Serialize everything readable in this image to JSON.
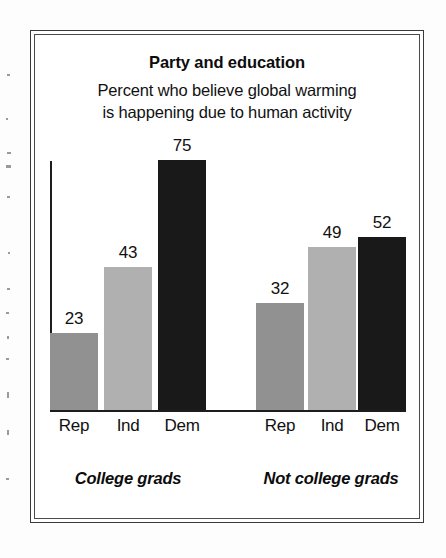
{
  "figure": {
    "title": "Party and education",
    "subtitle_line1": "Percent who believe global warming",
    "subtitle_line2": "is happening due to human activity",
    "group_label_left": "College grads",
    "group_label_right": "Not college grads"
  },
  "chart_data": {
    "type": "bar",
    "title": "Party and education",
    "subtitle": "Percent who believe global warming is happening due to human activity",
    "xlabel": "",
    "ylabel": "",
    "ylim": [
      0,
      75
    ],
    "grid": false,
    "legend": "none",
    "value_labels": true,
    "categories": [
      "Rep",
      "Ind",
      "Dem",
      "Rep",
      "Ind",
      "Dem"
    ],
    "groups": [
      {
        "name": "College grads",
        "categories": [
          "Rep",
          "Ind",
          "Dem"
        ],
        "values": [
          23,
          43,
          75
        ]
      },
      {
        "name": "Not college grads",
        "categories": [
          "Rep",
          "Ind",
          "Dem"
        ],
        "values": [
          32,
          49,
          52
        ]
      }
    ],
    "values": [
      23,
      43,
      75,
      32,
      49,
      52
    ],
    "bars": [
      {
        "group": "College grads",
        "category": "Rep",
        "value": 23,
        "value_text": "23",
        "color": "#919191",
        "x": 19,
        "width": 48
      },
      {
        "group": "College grads",
        "category": "Ind",
        "value": 43,
        "value_text": "43",
        "color": "#b0b0b0",
        "x": 73,
        "width": 48
      },
      {
        "group": "College grads",
        "category": "Dem",
        "value": 75,
        "value_text": "75",
        "color": "#191919",
        "x": 127,
        "width": 48
      },
      {
        "group": "Not college grads",
        "category": "Rep",
        "value": 32,
        "value_text": "32",
        "color": "#919191",
        "x": 225,
        "width": 48
      },
      {
        "group": "Not college grads",
        "category": "Ind",
        "value": 49,
        "value_text": "49",
        "color": "#b0b0b0",
        "x": 277,
        "width": 48
      },
      {
        "group": "Not college grads",
        "category": "Dem",
        "value": 52,
        "value_text": "52",
        "color": "#191919",
        "x": 327,
        "width": 48
      }
    ],
    "colors": {
      "rep_bar": "#919191",
      "ind_bar": "#b0b0b0",
      "dem_bar": "#191919",
      "axis": "#1d1d1d",
      "text": "#111111",
      "frame": "#3a3a3a",
      "background": "#ffffff"
    }
  }
}
